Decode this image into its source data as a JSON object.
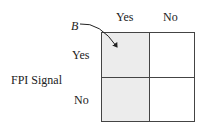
{
  "diagram": {
    "column_headers": [
      "Yes",
      "No"
    ],
    "row_headers": [
      "Yes",
      "No"
    ],
    "row_axis_label": "FPI Signal",
    "callout_label": "B",
    "shaded_column_index": 0,
    "shade_color": "#ececec",
    "line_color": "#444444"
  }
}
